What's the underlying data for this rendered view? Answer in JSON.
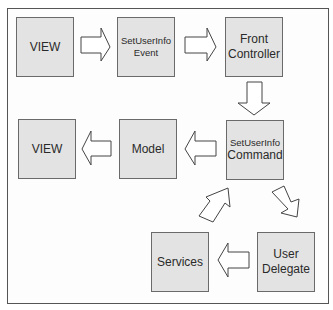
{
  "diagram": {
    "nodes": [
      {
        "id": "view-top",
        "lines": [
          "VIEW"
        ]
      },
      {
        "id": "setuserinfo-event",
        "lines": [
          "SetUserInfo",
          "Event"
        ]
      },
      {
        "id": "front-controller",
        "lines": [
          "Front",
          "Controller"
        ]
      },
      {
        "id": "setuserinfo-command",
        "lines": [
          "SetUserInfo",
          "Command"
        ]
      },
      {
        "id": "model",
        "lines": [
          "Model"
        ]
      },
      {
        "id": "view-bottom",
        "lines": [
          "VIEW"
        ]
      },
      {
        "id": "user-delegate",
        "lines": [
          "User",
          "Delegate"
        ]
      },
      {
        "id": "services",
        "lines": [
          "Services"
        ]
      }
    ],
    "edges": [
      {
        "from": "view-top",
        "to": "setuserinfo-event"
      },
      {
        "from": "setuserinfo-event",
        "to": "front-controller"
      },
      {
        "from": "front-controller",
        "to": "setuserinfo-command"
      },
      {
        "from": "setuserinfo-command",
        "to": "model"
      },
      {
        "from": "model",
        "to": "view-bottom"
      },
      {
        "from": "setuserinfo-command",
        "to": "user-delegate"
      },
      {
        "from": "user-delegate",
        "to": "services"
      },
      {
        "from": "services",
        "to": "setuserinfo-command"
      }
    ],
    "colors": {
      "box_fill": "#e3e3e3",
      "box_border": "#6a6a6a",
      "arrow_fill": "#ffffff",
      "frame_border": "#555555"
    }
  }
}
